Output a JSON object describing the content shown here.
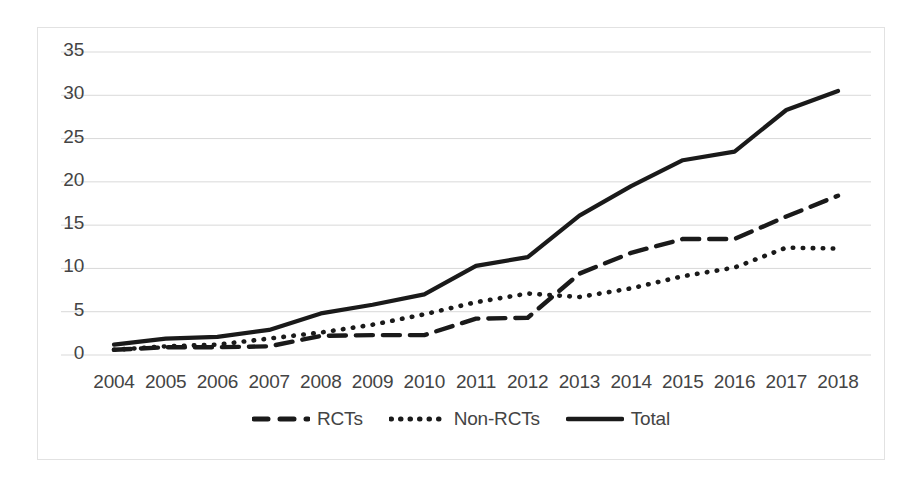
{
  "chart_data": {
    "type": "line",
    "title": "",
    "subtitle": "",
    "xlabel": "",
    "ylabel": "",
    "categories": [
      "2004",
      "2005",
      "2006",
      "2007",
      "2008",
      "2009",
      "2010",
      "2011",
      "2012",
      "2013",
      "2014",
      "2015",
      "2016",
      "2017",
      "2018"
    ],
    "x": [
      2004,
      2005,
      2006,
      2007,
      2008,
      2009,
      2010,
      2011,
      2012,
      2013,
      2014,
      2015,
      2016,
      2017,
      2018
    ],
    "series": [
      {
        "name": "RCTs",
        "style": "dashed",
        "color": "#1a1a1a",
        "values": [
          0.6,
          0.9,
          0.9,
          1.0,
          2.2,
          2.3,
          2.3,
          4.2,
          4.3,
          9.4,
          11.8,
          13.4,
          13.4,
          16.0,
          18.4
        ]
      },
      {
        "name": "Non-RCTs",
        "style": "dotted",
        "color": "#1a1a1a",
        "values": [
          0.6,
          1.0,
          1.2,
          1.9,
          2.6,
          3.5,
          4.7,
          6.1,
          7.1,
          6.7,
          7.7,
          9.1,
          10.1,
          12.4,
          12.3
        ]
      },
      {
        "name": "Total",
        "style": "solid",
        "color": "#1a1a1a",
        "values": [
          1.2,
          1.9,
          2.1,
          2.9,
          4.8,
          5.8,
          7.0,
          10.3,
          11.3,
          16.1,
          19.5,
          22.5,
          23.5,
          28.3,
          30.5
        ]
      }
    ],
    "ylim": [
      0,
      35
    ],
    "yticks": [
      0,
      5,
      10,
      15,
      20,
      25,
      30,
      35
    ],
    "ytick_labels": [
      "0",
      "5",
      "10",
      "15",
      "20",
      "25",
      "30",
      "35"
    ],
    "grid": true,
    "grid_axis": "y",
    "grid_color": "#d9d9d9",
    "legend_position": "bottom",
    "legend_entries": [
      "RCTs",
      "Non-RCTs",
      "Total"
    ],
    "plot_background": "#ffffff",
    "border_color": "#e2e2e2"
  }
}
